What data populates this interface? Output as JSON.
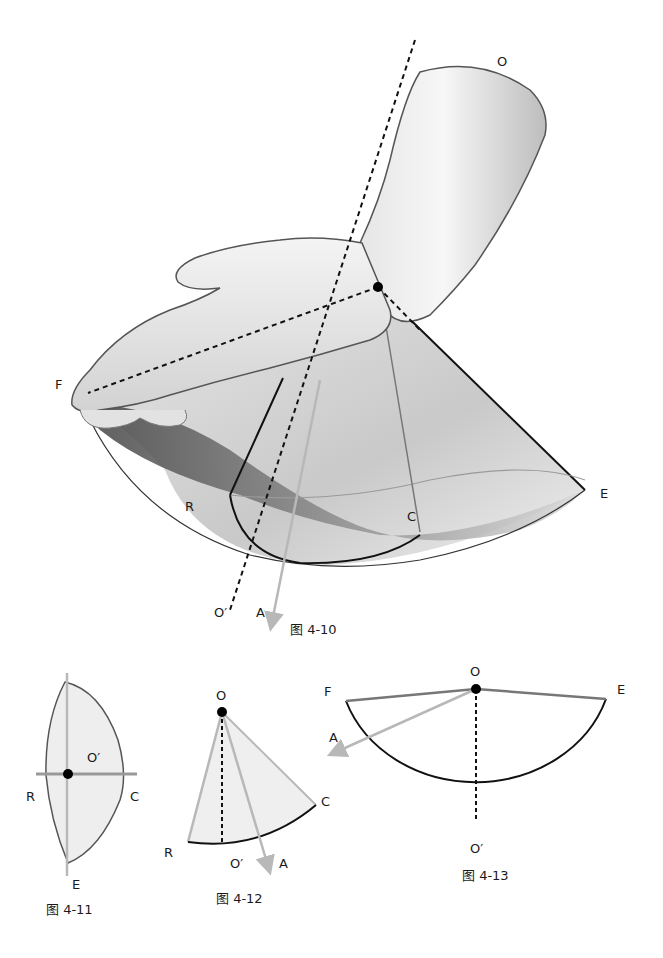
{
  "colors": {
    "outline": "#555555",
    "dark_line": "#111111",
    "axis_arrow": "#b8b8b8",
    "skin_light": "#f2f2f2",
    "skin_mid": "#d6d6d6",
    "shadow_dark": "#5a5a5a",
    "sector_fill": "#eeeeee"
  },
  "figure_4_10": {
    "caption": "图 4-10",
    "labels": {
      "O": "O",
      "F": "F",
      "E": "E",
      "R": "R",
      "C": "C",
      "O_prime": "O′",
      "A": "A"
    }
  },
  "figure_4_11": {
    "caption": "图 4-11",
    "labels": {
      "O_prime": "O′",
      "R": "R",
      "C": "C",
      "E": "E"
    }
  },
  "figure_4_12": {
    "caption": "图 4-12",
    "labels": {
      "O": "O",
      "R": "R",
      "C": "C",
      "O_prime": "O′",
      "A": "A"
    }
  },
  "figure_4_13": {
    "caption": "图 4-13",
    "labels": {
      "O": "O",
      "F": "F",
      "E": "E",
      "A": "A",
      "O_prime": "O′"
    }
  }
}
